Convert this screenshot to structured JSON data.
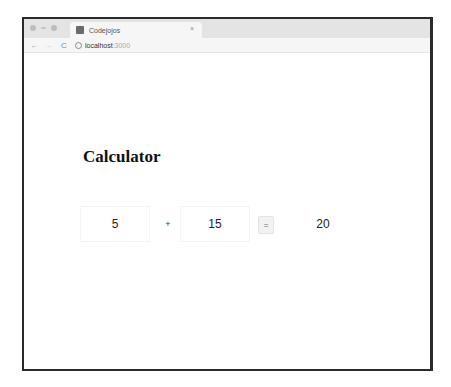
{
  "browser": {
    "tab": {
      "title": "Codejojos",
      "close_icon": "×"
    },
    "toolbar": {
      "back_icon": "←",
      "forward_icon": "→",
      "reload_icon": "C",
      "url_host": "localhost",
      "url_port": ":3000"
    }
  },
  "page": {
    "heading": "Calculator",
    "calculator": {
      "operand_a": "5",
      "operator": "+",
      "operand_b": "15",
      "equals_label": "=",
      "result": "20"
    }
  }
}
